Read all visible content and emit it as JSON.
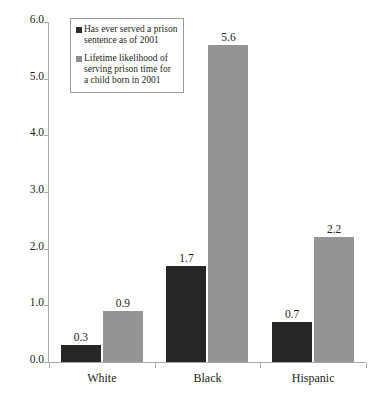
{
  "chart_data": {
    "type": "bar",
    "title": "",
    "subtitle": "",
    "xlabel": "",
    "ylabel": "",
    "categories": [
      "White",
      "Black",
      "Hispanic"
    ],
    "series": [
      {
        "name": "Has ever served a prison sentence as of 2001",
        "color": "#262626",
        "values": [
          0.3,
          1.7,
          0.7
        ],
        "labels": [
          "0.3",
          "1.7",
          "0.7"
        ]
      },
      {
        "name": "Lifetime likelihood of serving prison time for a child born in 2001",
        "color": "#949494",
        "values": [
          0.9,
          5.6,
          2.2
        ],
        "labels": [
          "0.9",
          "5.6",
          "2.2"
        ]
      }
    ],
    "ylim": [
      0.0,
      6.0
    ],
    "ytick_values": [
      6.0,
      5.0,
      4.0,
      3.0,
      2.0,
      1.0,
      0.0
    ],
    "ytick_labels": [
      "6.0",
      "5.0",
      "4.0",
      "3.0",
      "2.0",
      "1.0",
      "0.0"
    ],
    "grid": false,
    "legend_position": "top-left",
    "legend": [
      {
        "swatch": "dark",
        "lines": [
          "Has ever served a prison",
          "sentence as of 2001"
        ]
      },
      {
        "swatch": "light",
        "lines": [
          "Lifetime likelihood of",
          "serving prison time for",
          "a child born in 2001"
        ]
      }
    ]
  },
  "colors": {
    "series_dark": "#262626",
    "series_light": "#949494",
    "axis": "#a9a9a9",
    "text": "#231f20",
    "legend_border": "#9b9b9b",
    "background": "#ffffff"
  }
}
